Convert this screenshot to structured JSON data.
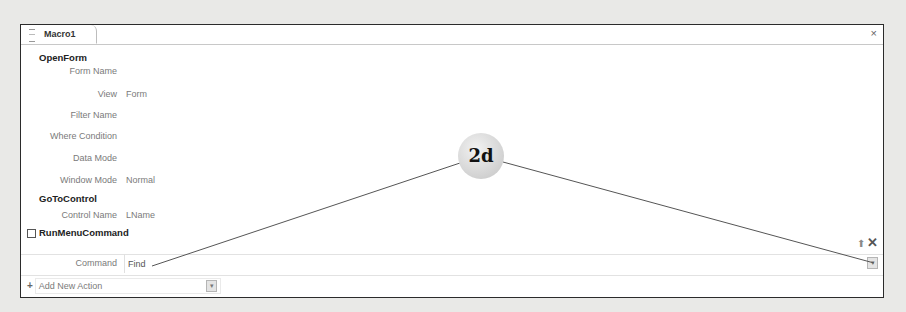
{
  "window": {
    "tab_label": "Macro1",
    "close_icon": "close-icon"
  },
  "actions": [
    {
      "name": "OpenForm",
      "arguments": [
        {
          "label": "Form Name",
          "value": ""
        },
        {
          "label": "View",
          "value": "Form"
        },
        {
          "label": "Filter Name",
          "value": ""
        },
        {
          "label": "Where Condition",
          "value": ""
        },
        {
          "label": "Data Mode",
          "value": ""
        },
        {
          "label": "Window Mode",
          "value": "Normal"
        }
      ]
    },
    {
      "name": "GoToControl",
      "arguments": [
        {
          "label": "Control Name",
          "value": "LName"
        }
      ]
    },
    {
      "name": "RunMenuCommand",
      "expanded": true,
      "arguments": [
        {
          "label": "Command",
          "value": "Find"
        }
      ]
    }
  ],
  "add_new_action": {
    "label": "Add New Action"
  },
  "callout": {
    "label": "2d"
  },
  "icons": {
    "collapse": "⊟",
    "plus": "+",
    "up_arrow": "⬆",
    "delete": "✕",
    "close": "×",
    "dropdown": "▾"
  }
}
